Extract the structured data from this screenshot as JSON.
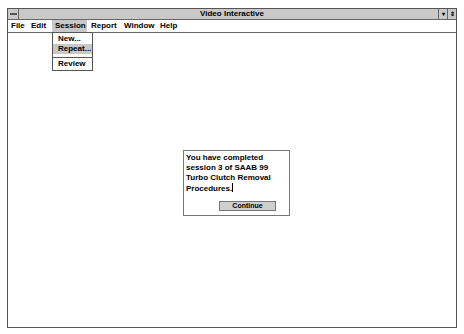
{
  "window": {
    "title": "Video Interactive",
    "controls": {
      "minimize_glyph": "▾",
      "maximize_glyph": "⇕"
    }
  },
  "menubar": {
    "items": [
      {
        "label": "File"
      },
      {
        "label": "Edit"
      },
      {
        "label": "Session",
        "active": true
      },
      {
        "label": "Report"
      },
      {
        "label": "Window"
      },
      {
        "label": "Help"
      }
    ]
  },
  "session_menu": {
    "items": [
      {
        "label": "New..."
      },
      {
        "label": "Repeat...",
        "highlighted": true
      },
      {
        "label": "Review"
      }
    ]
  },
  "dialog": {
    "message": "You have completed session 3 of SAAB 99 Turbo Clutch Removal Procedures.",
    "continue_label": "Continue"
  },
  "colors": {
    "titlebar": "#c9c9c9",
    "highlight": "#c8c8c8",
    "border": "#555555"
  }
}
